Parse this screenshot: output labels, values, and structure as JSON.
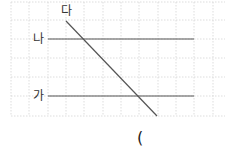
{
  "diagram": {
    "labels": {
      "line_da": "다",
      "line_na": "나",
      "line_ga": "가"
    },
    "answer_paren": "(",
    "colors": {
      "grid": "#cfcfcf",
      "line": "#555555",
      "text": "#333333"
    },
    "grid": {
      "x": [
        11,
        29,
        48,
        66,
        84,
        103,
        121,
        139,
        158,
        176,
        194,
        213
      ],
      "y": [
        2,
        20,
        39,
        58,
        77,
        96,
        116
      ]
    },
    "lines": [
      {
        "name": "나",
        "x1": 48,
        "y1": 39,
        "x2": 194,
        "y2": 39
      },
      {
        "name": "가",
        "x1": 48,
        "y1": 96,
        "x2": 194,
        "y2": 96
      },
      {
        "name": "다",
        "x1": 66,
        "y1": 21,
        "x2": 157,
        "y2": 116
      }
    ]
  }
}
